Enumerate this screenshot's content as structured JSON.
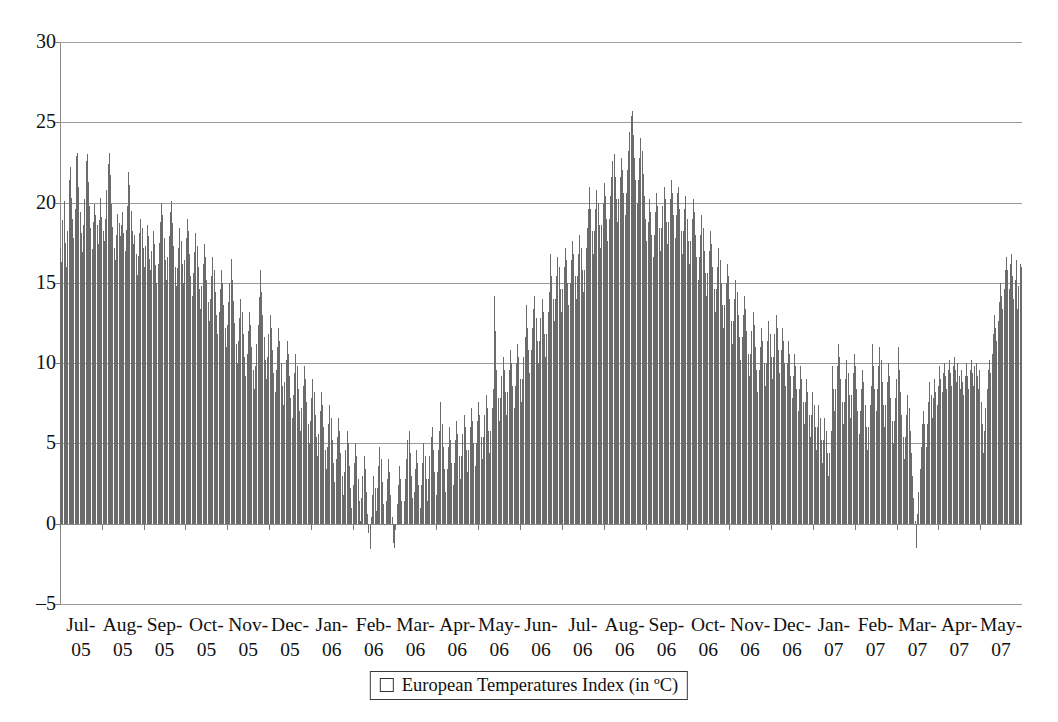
{
  "chart_data": {
    "type": "bar",
    "title": "",
    "subtitle": "",
    "xlabel": "",
    "ylabel": "",
    "ylim": [
      -5,
      30
    ],
    "y_ticks": [
      -5,
      0,
      5,
      10,
      15,
      20,
      25,
      30
    ],
    "grid": true,
    "legend_position": "bottom",
    "legend": [
      "European Temperatures Index (in ºC)"
    ],
    "series_name": "European Temperatures Index (in ºC)",
    "bar_color": "#6b6b6b",
    "gridline_color": "#9a9a9a",
    "x_tick_labels": [
      {
        "month": "Jul-",
        "year": "05"
      },
      {
        "month": "Aug-",
        "year": "05"
      },
      {
        "month": "Sep-",
        "year": "05"
      },
      {
        "month": "Oct-",
        "year": "05"
      },
      {
        "month": "Nov-",
        "year": "05"
      },
      {
        "month": "Dec-",
        "year": "05"
      },
      {
        "month": "Jan-",
        "year": "06"
      },
      {
        "month": "Feb-",
        "year": "06"
      },
      {
        "month": "Mar-",
        "year": "06"
      },
      {
        "month": "Apr-",
        "year": "06"
      },
      {
        "month": "May-",
        "year": "06"
      },
      {
        "month": "Jun-",
        "year": "06"
      },
      {
        "month": "Jul-",
        "year": "06"
      },
      {
        "month": "Aug-",
        "year": "06"
      },
      {
        "month": "Sep-",
        "year": "06"
      },
      {
        "month": "Oct-",
        "year": "06"
      },
      {
        "month": "Nov-",
        "year": "06"
      },
      {
        "month": "Dec-",
        "year": "06"
      },
      {
        "month": "Jan-",
        "year": "07"
      },
      {
        "month": "Feb-",
        "year": "07"
      },
      {
        "month": "Mar-",
        "year": "07"
      },
      {
        "month": "Apr-",
        "year": "07"
      },
      {
        "month": "May-",
        "year": "07"
      }
    ],
    "x_description": "Daily observations from 1 Jul 2005 to approximately 31 May 2007",
    "n_points": 700,
    "y_min_observed": -1.6,
    "y_max_observed": 25.7,
    "values": [
      17.2,
      16.3,
      18.9,
      20.1,
      17.5,
      16.0,
      18.2,
      21.4,
      22.2,
      20.3,
      19.0,
      17.8,
      19.6,
      22.9,
      23.1,
      21.0,
      19.4,
      18.1,
      16.9,
      18.6,
      20.2,
      22.6,
      23.0,
      21.3,
      19.8,
      18.4,
      17.1,
      18.8,
      19.9,
      19.2,
      18.6,
      17.4,
      18.9,
      20.3,
      19.1,
      18.2,
      17.6,
      19.0,
      20.8,
      22.4,
      23.1,
      21.7,
      19.9,
      18.5,
      17.2,
      16.4,
      18.0,
      19.3,
      18.7,
      17.9,
      18.6,
      19.4,
      18.1,
      17.0,
      18.3,
      19.8,
      21.9,
      21.1,
      19.5,
      18.2,
      17.4,
      18.0,
      16.8,
      15.5,
      16.7,
      18.1,
      19.0,
      18.4,
      17.2,
      16.0,
      17.3,
      18.6,
      17.9,
      16.5,
      15.8,
      17.0,
      18.2,
      17.4,
      16.1,
      15.0,
      16.2,
      17.5,
      18.8,
      20.0,
      19.2,
      17.8,
      16.4,
      15.2,
      16.6,
      17.9,
      19.4,
      20.1,
      18.7,
      17.3,
      16.0,
      14.8,
      15.9,
      17.2,
      18.4,
      17.6,
      16.2,
      15.0,
      16.4,
      17.8,
      19.0,
      18.2,
      16.8,
      15.4,
      14.2,
      15.6,
      16.9,
      18.1,
      17.3,
      16.0,
      14.6,
      13.4,
      14.8,
      16.2,
      17.4,
      16.6,
      15.2,
      13.8,
      12.6,
      14.0,
      15.4,
      16.6,
      15.8,
      14.4,
      13.0,
      11.8,
      13.2,
      14.6,
      15.8,
      15.0,
      13.6,
      12.2,
      11.0,
      12.4,
      13.8,
      15.0,
      16.5,
      15.2,
      13.9,
      12.5,
      11.2,
      10.0,
      11.4,
      12.8,
      14.0,
      13.2,
      11.8,
      10.4,
      9.2,
      10.6,
      12.0,
      13.2,
      12.4,
      11.0,
      9.6,
      8.4,
      9.8,
      11.2,
      12.4,
      14.1,
      15.8,
      14.4,
      13.0,
      11.6,
      10.2,
      9.0,
      10.4,
      11.8,
      13.0,
      12.2,
      10.8,
      9.4,
      8.2,
      9.6,
      11.0,
      12.2,
      11.4,
      10.0,
      8.6,
      7.4,
      8.8,
      10.2,
      11.4,
      10.6,
      9.2,
      7.8,
      6.6,
      8.0,
      9.4,
      10.6,
      9.8,
      8.4,
      7.0,
      5.8,
      7.2,
      8.6,
      9.8,
      9.0,
      7.6,
      6.2,
      5.0,
      6.4,
      7.8,
      9.0,
      8.2,
      6.8,
      5.4,
      4.2,
      5.6,
      7.0,
      8.2,
      7.4,
      6.0,
      4.6,
      3.4,
      4.8,
      6.2,
      7.4,
      6.6,
      5.2,
      3.8,
      2.6,
      4.0,
      5.4,
      6.6,
      5.8,
      4.4,
      3.0,
      1.8,
      3.2,
      4.6,
      5.8,
      5.0,
      3.6,
      2.2,
      1.0,
      2.4,
      3.8,
      5.0,
      4.2,
      2.8,
      1.4,
      0.2,
      1.6,
      3.0,
      4.2,
      3.4,
      2.0,
      0.6,
      -0.6,
      -1.6,
      0.4,
      1.8,
      3.0,
      2.2,
      0.8,
      2.2,
      3.6,
      4.8,
      4.0,
      2.6,
      1.2,
      0.0,
      1.4,
      2.8,
      4.0,
      3.2,
      1.8,
      0.4,
      -1.2,
      -1.5,
      -0.2,
      1.2,
      2.4,
      3.6,
      2.8,
      1.4,
      0.0,
      1.4,
      2.8,
      4.0,
      5.2,
      5.8,
      4.4,
      3.0,
      1.6,
      2.0,
      3.4,
      4.6,
      3.8,
      2.4,
      1.0,
      2.4,
      3.8,
      5.0,
      4.2,
      2.8,
      1.4,
      2.8,
      4.2,
      5.4,
      6.0,
      4.6,
      3.2,
      1.8,
      3.2,
      4.6,
      5.8,
      7.6,
      6.2,
      4.8,
      3.4,
      2.0,
      3.4,
      4.8,
      6.0,
      5.2,
      3.8,
      2.4,
      3.8,
      5.2,
      6.4,
      5.6,
      4.2,
      2.8,
      4.2,
      5.6,
      6.8,
      6.0,
      4.6,
      3.2,
      4.6,
      6.0,
      7.2,
      6.4,
      5.0,
      3.6,
      5.0,
      6.4,
      7.6,
      6.8,
      5.4,
      4.0,
      5.4,
      6.8,
      8.0,
      7.2,
      5.8,
      4.4,
      5.8,
      7.2,
      8.4,
      14.2,
      12.0,
      9.6,
      7.8,
      6.4,
      7.8,
      9.2,
      10.4,
      9.6,
      8.2,
      6.8,
      8.2,
      9.6,
      10.8,
      10.0,
      8.6,
      7.2,
      8.6,
      10.0,
      11.2,
      10.4,
      9.0,
      7.6,
      9.0,
      10.4,
      11.6,
      13.6,
      12.2,
      10.8,
      9.4,
      10.8,
      12.2,
      13.4,
      14.2,
      12.8,
      11.4,
      10.0,
      11.4,
      12.8,
      14.0,
      13.2,
      11.8,
      10.4,
      11.8,
      13.2,
      14.4,
      16.8,
      15.4,
      14.0,
      12.6,
      14.0,
      15.4,
      16.6,
      16.0,
      14.6,
      13.2,
      14.6,
      16.0,
      17.2,
      16.4,
      15.0,
      13.6,
      15.0,
      16.4,
      17.6,
      16.8,
      15.4,
      14.0,
      15.4,
      16.8,
      18.0,
      17.2,
      15.8,
      14.4,
      15.8,
      17.2,
      18.4,
      19.6,
      21.0,
      19.6,
      18.2,
      16.8,
      18.2,
      19.6,
      20.8,
      20.0,
      18.6,
      17.2,
      18.6,
      20.0,
      21.2,
      20.4,
      19.0,
      17.6,
      19.0,
      20.4,
      21.6,
      22.6,
      23.0,
      21.6,
      20.2,
      18.8,
      20.2,
      21.6,
      22.8,
      22.0,
      20.6,
      19.2,
      20.6,
      22.0,
      23.2,
      24.4,
      25.4,
      25.7,
      24.2,
      22.8,
      21.4,
      20.0,
      21.4,
      22.8,
      24.0,
      23.2,
      21.8,
      20.4,
      19.0,
      17.6,
      18.8,
      20.2,
      19.4,
      18.0,
      16.6,
      18.0,
      19.4,
      20.6,
      19.8,
      18.4,
      17.0,
      18.4,
      19.8,
      21.0,
      20.2,
      18.8,
      17.4,
      18.8,
      20.2,
      21.4,
      20.6,
      19.2,
      17.8,
      19.2,
      20.6,
      21.0,
      19.6,
      18.2,
      16.8,
      18.2,
      19.6,
      20.4,
      19.0,
      17.6,
      16.2,
      17.6,
      19.0,
      20.2,
      19.4,
      18.0,
      16.6,
      15.2,
      16.6,
      18.0,
      19.2,
      18.4,
      17.0,
      15.6,
      14.2,
      15.6,
      17.0,
      18.2,
      17.4,
      16.0,
      14.6,
      13.2,
      14.6,
      16.0,
      17.2,
      16.4,
      15.0,
      13.6,
      12.2,
      13.6,
      15.0,
      16.2,
      15.4,
      14.0,
      12.6,
      11.2,
      12.6,
      14.0,
      15.2,
      14.4,
      13.0,
      11.6,
      10.2,
      11.6,
      13.0,
      14.2,
      13.4,
      12.0,
      10.6,
      9.2,
      10.6,
      12.0,
      13.2,
      12.4,
      11.0,
      9.6,
      8.2,
      9.6,
      11.0,
      12.2,
      11.4,
      10.0,
      8.6,
      10.0,
      11.4,
      12.6,
      11.8,
      10.4,
      9.0,
      10.4,
      11.8,
      13.0,
      12.2,
      10.8,
      9.4,
      10.8,
      12.2,
      11.4,
      10.0,
      8.6,
      10.0,
      11.4,
      10.6,
      9.2,
      7.8,
      9.2,
      10.6,
      9.8,
      8.4,
      7.0,
      8.4,
      9.8,
      9.0,
      7.6,
      6.2,
      7.6,
      9.0,
      8.2,
      6.8,
      5.4,
      6.8,
      8.2,
      7.4,
      6.0,
      4.6,
      6.0,
      7.4,
      6.6,
      5.2,
      3.8,
      5.2,
      6.6,
      5.8,
      4.4,
      3.0,
      4.4,
      5.8,
      9.8,
      8.4,
      7.0,
      8.4,
      9.8,
      11.2,
      10.4,
      9.0,
      7.6,
      6.2,
      7.6,
      9.0,
      10.2,
      9.4,
      8.0,
      6.6,
      8.0,
      9.4,
      10.6,
      9.8,
      8.4,
      7.0,
      5.6,
      7.0,
      8.4,
      9.6,
      8.8,
      7.4,
      6.0,
      4.6,
      6.0,
      7.4,
      8.6,
      11.2,
      9.8,
      8.4,
      7.0,
      8.4,
      9.8,
      11.0,
      10.2,
      8.8,
      7.4,
      6.0,
      7.4,
      8.8,
      10.0,
      9.2,
      7.8,
      6.4,
      5.0,
      6.4,
      7.8,
      9.0,
      11.0,
      9.6,
      8.2,
      6.8,
      5.4,
      4.0,
      5.4,
      6.8,
      8.0,
      7.2,
      5.8,
      4.4,
      3.0,
      1.6,
      0.2,
      -1.5,
      0.6,
      2.0,
      3.4,
      4.8,
      6.2,
      7.0,
      6.2,
      4.8,
      6.2,
      7.6,
      8.8,
      8.0,
      6.6,
      7.8,
      9.0,
      8.2,
      7.4,
      8.6,
      9.8,
      9.0,
      8.2,
      9.4,
      10.0,
      9.2,
      8.4,
      9.6,
      10.2,
      9.4,
      8.6,
      9.8,
      10.4,
      9.6,
      8.8,
      10.0,
      9.2,
      8.4,
      9.6,
      8.8,
      8.0,
      9.2,
      10.0,
      9.2,
      8.4,
      9.6,
      10.2,
      9.4,
      8.6,
      9.8,
      10.0,
      9.2,
      8.4,
      9.6,
      7.6,
      6.2,
      4.4,
      5.8,
      7.2,
      8.4,
      9.6,
      10.2,
      9.4,
      10.6,
      11.8,
      13.0,
      12.2,
      11.4,
      12.6,
      13.8,
      15.0,
      14.2,
      13.4,
      14.6,
      15.8,
      16.6,
      15.8,
      14.6,
      16.2,
      16.8,
      15.4,
      14.0,
      15.2,
      16.4,
      13.4,
      14.8,
      16.2,
      16.0
    ]
  }
}
